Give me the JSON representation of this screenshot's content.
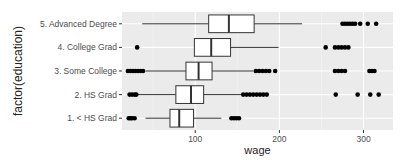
{
  "chart_data": {
    "type": "boxplot",
    "orientation": "horizontal",
    "title": "",
    "xlabel": "wage",
    "ylabel": "factor(education)",
    "xlim": [
      13,
      335
    ],
    "x_ticks": [
      100,
      200,
      300
    ],
    "grid": true,
    "legend": "none",
    "categories": [
      "1. < HS Grad",
      "2. HS Grad",
      "3. Some College",
      "4. College Grad",
      "5. Advanced Degree"
    ],
    "series": [
      {
        "name": "1. < HS Grad",
        "whisker_low": 41,
        "q1": 70,
        "median": 81,
        "q3": 98,
        "whisker_high": 131,
        "outliers": [
          21,
          23,
          25,
          28,
          143,
          146,
          149,
          152
        ]
      },
      {
        "name": "2. HS Grad",
        "whisker_low": 31,
        "q1": 77,
        "median": 95,
        "q3": 110,
        "whisker_high": 155,
        "outliers": [
          22,
          25,
          28,
          30,
          157,
          161,
          165,
          169,
          173,
          177,
          181,
          185,
          267,
          293,
          308,
          318
        ]
      },
      {
        "name": "3. Some College",
        "whisker_low": 41,
        "q1": 89,
        "median": 104,
        "q3": 120,
        "whisker_high": 169,
        "outliers": [
          20,
          23,
          26,
          29,
          32,
          35,
          38,
          172,
          176,
          180,
          184,
          188,
          195,
          266,
          270,
          274,
          278,
          307,
          310,
          313
        ]
      },
      {
        "name": "4. College Grad",
        "whisker_low": 99,
        "q1": 99,
        "median": 119,
        "q3": 142,
        "whisker_high": 199,
        "outliers": [
          31,
          255,
          266,
          270,
          274,
          278,
          282
        ]
      },
      {
        "name": "5. Advanced Degree",
        "whisker_low": 37,
        "q1": 116,
        "median": 140,
        "q3": 170,
        "whisker_high": 227,
        "outliers": [
          275,
          278,
          281,
          284,
          287,
          290,
          296,
          305,
          315
        ]
      }
    ]
  },
  "axes": {
    "x_title": "wage",
    "y_title": "factor(education)",
    "x_tick_labels": [
      "100",
      "200",
      "300"
    ],
    "y_tick_labels": [
      "1. < HS Grad",
      "2. HS Grad",
      "3. Some College",
      "4. College Grad",
      "5. Advanced Degree"
    ]
  },
  "colors": {
    "panel_bg": "#ebebeb",
    "grid_major": "#ffffff",
    "box_fill": "#ffffff",
    "box_stroke": "#333333",
    "point": "#000000"
  }
}
